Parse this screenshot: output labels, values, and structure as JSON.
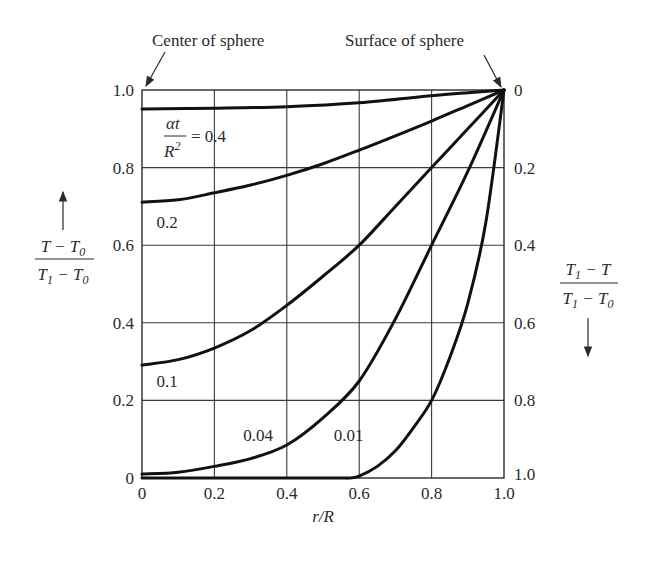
{
  "chart_data": {
    "type": "line",
    "title": "",
    "xlabel": "r/R",
    "ylabel_left": "(T - T0)/(T1 - T0)",
    "ylabel_right": "(T1 - T)/(T1 - T0)",
    "xlim": [
      0,
      1.0
    ],
    "ylim": [
      0,
      1.0
    ],
    "grid": true,
    "x_ticks": [
      "0",
      "0.2",
      "0.4",
      "0.6",
      "0.8",
      "1.0"
    ],
    "y_ticks_left": [
      "0",
      "0.2",
      "0.4",
      "0.6",
      "0.8",
      "1.0"
    ],
    "y_ticks_right": [
      "1.0",
      "0.8",
      "0.6",
      "0.4",
      "0.2",
      "0"
    ],
    "annotations": {
      "center": "Center of sphere",
      "surface": "Surface of sphere",
      "param_prefix": "αt/R² = "
    },
    "series": [
      {
        "name": "0.4",
        "label": "0.4",
        "x": [
          0,
          0.2,
          0.4,
          0.6,
          0.8,
          0.9,
          1.0
        ],
        "y": [
          0.951,
          0.953,
          0.957,
          0.967,
          0.985,
          0.993,
          1.0
        ]
      },
      {
        "name": "0.2",
        "label": "0.2",
        "x": [
          0,
          0.1,
          0.2,
          0.3,
          0.4,
          0.5,
          0.6,
          0.7,
          0.8,
          0.9,
          1.0
        ],
        "y": [
          0.711,
          0.717,
          0.735,
          0.755,
          0.78,
          0.81,
          0.845,
          0.882,
          0.92,
          0.96,
          1.0
        ]
      },
      {
        "name": "0.1",
        "label": "0.1",
        "x": [
          0,
          0.1,
          0.2,
          0.3,
          0.4,
          0.5,
          0.6,
          0.7,
          0.8,
          0.9,
          1.0
        ],
        "y": [
          0.291,
          0.305,
          0.335,
          0.38,
          0.445,
          0.52,
          0.6,
          0.7,
          0.8,
          0.9,
          1.0
        ]
      },
      {
        "name": "0.04",
        "label": "0.04",
        "x": [
          0,
          0.1,
          0.2,
          0.3,
          0.4,
          0.5,
          0.6,
          0.7,
          0.8,
          0.9,
          1.0
        ],
        "y": [
          0.01,
          0.015,
          0.03,
          0.05,
          0.085,
          0.155,
          0.25,
          0.41,
          0.6,
          0.79,
          1.0
        ]
      },
      {
        "name": "0.01",
        "label": "0.01",
        "x": [
          0,
          0.5,
          0.57,
          0.6,
          0.65,
          0.7,
          0.75,
          0.8,
          0.85,
          0.9,
          0.95,
          1.0
        ],
        "y": [
          0.0,
          0.0,
          0.0,
          0.005,
          0.03,
          0.07,
          0.13,
          0.2,
          0.31,
          0.45,
          0.66,
          1.0
        ]
      }
    ],
    "labels": [
      {
        "text": "0.2",
        "x": 0.04,
        "y": 0.645
      },
      {
        "text": "0.1",
        "x": 0.04,
        "y": 0.235
      },
      {
        "text": "0.04",
        "x": 0.28,
        "y": 0.095
      },
      {
        "text": "0.01",
        "x": 0.53,
        "y": 0.095
      }
    ]
  }
}
